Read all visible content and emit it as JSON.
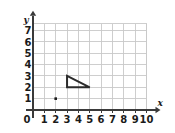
{
  "chart_data": {
    "type": "scatter",
    "title": "",
    "xlabel": "x",
    "ylabel": "y",
    "xlim": [
      0,
      10
    ],
    "ylim": [
      0,
      7.6
    ],
    "grid": true,
    "legend": false,
    "x_ticks": [
      0,
      1,
      2,
      3,
      4,
      5,
      6,
      7,
      8,
      9,
      10
    ],
    "x_tick_labels": [
      "0",
      "1",
      "2",
      "3",
      "4",
      "5",
      "6",
      "7",
      "8",
      "9",
      "10"
    ],
    "y_ticks": [
      1,
      2,
      3,
      4,
      5,
      6,
      7
    ],
    "y_tick_labels": [
      "1",
      "2",
      "3",
      "4",
      "5",
      "6",
      "7"
    ],
    "origin_label": "0",
    "points": [
      {
        "label": "plotted-point",
        "x": 2,
        "y": 1
      }
    ],
    "shapes": [
      {
        "name": "right-triangle",
        "type": "polygon",
        "closed": true,
        "fill": "none",
        "stroke": "#2b2b2b",
        "vertices": [
          {
            "x": 3,
            "y": 3
          },
          {
            "x": 3,
            "y": 2
          },
          {
            "x": 5,
            "y": 2
          }
        ]
      }
    ],
    "colors": {
      "background": "#ffffff",
      "gridline": "#c9c9c9",
      "axis": "#3a3a3a",
      "shape_stroke": "#2b2b2b",
      "point": "#1a1a1a",
      "tick_text": "#1a1a1a"
    }
  }
}
